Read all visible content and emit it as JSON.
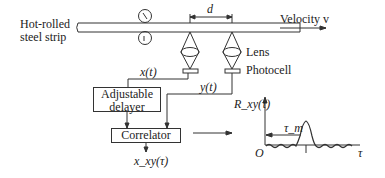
{
  "diagram": {
    "strip_label_line1": "Hot-rolled",
    "strip_label_line2": "steel strip",
    "distance_label": "d",
    "velocity_label": "Velocity v",
    "lens_label": "Lens",
    "photocell_label": "Photocell",
    "signal_x": "x(t)",
    "signal_y": "y(t)",
    "delayer_line1": "Adjustable",
    "delayer_line2": "delayer",
    "correlator_label": "Correlator",
    "output_label": "x_xy(τ)",
    "plot": {
      "ylabel": "R_xy(τ)",
      "xlabel": "τ",
      "origin": "O",
      "peak_label": "τ_m"
    }
  }
}
